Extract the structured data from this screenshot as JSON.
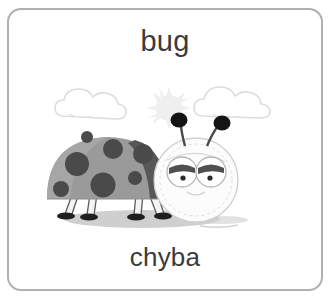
{
  "card": {
    "word_top": "bug",
    "word_bottom": "chyba",
    "border_color": "#b0b0b0",
    "background_color": "#ffffff",
    "text_color": "#3b3b3b"
  },
  "illustration": {
    "name": "ladybug-illustration",
    "description": "grayscale cartoon ladybug standing on ground shadow with sun and two clouds in the sky",
    "colors": {
      "body": "#9a9a9a",
      "body_shade": "#808080",
      "spots": "#4a4a4a",
      "wing_edge": "#5a5a5a",
      "head": "#fbfbfb",
      "head_outline": "#c8c8c8",
      "antenna_knob": "#1a1a1a",
      "leg": "#f2f2f2",
      "leg_outline": "#4a4a4a",
      "foot": "#1f1f1f",
      "ground_shadow": "#b9b9b9",
      "cloud_outline": "#dcdcdc",
      "sun": "#e2e2e2"
    },
    "parts": [
      "sun",
      "cloud-left",
      "cloud-right",
      "ground-shadow",
      "body-dome",
      "wing-edge",
      "spots",
      "legs",
      "head",
      "eyes",
      "antennae"
    ]
  }
}
